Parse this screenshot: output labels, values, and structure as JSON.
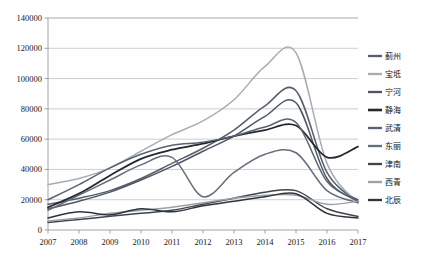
{
  "chart_data": {
    "type": "line",
    "title": "",
    "subtitle": "",
    "xlabel": "",
    "ylabel": "",
    "grid": true,
    "legend_position": "right",
    "x": [
      2007,
      2008,
      2009,
      2010,
      2011,
      2012,
      2013,
      2014,
      2015,
      2016,
      2017
    ],
    "xtick_labels": [
      "2007",
      "2008",
      "2009",
      "2010",
      "2011",
      "2012",
      "2013",
      "2014",
      "2015",
      "2016",
      "2017"
    ],
    "ylim": [
      0,
      140000
    ],
    "ytick_values": [
      0,
      20000,
      40000,
      60000,
      80000,
      100000,
      120000,
      140000
    ],
    "ytick_labels": [
      "0",
      "20000",
      "40000",
      "60000",
      "80000",
      "100000",
      "120000",
      "140000"
    ],
    "series": [
      {
        "name": "蓟州",
        "color": "#555f6b",
        "width": 1.5,
        "values": [
          17000,
          21000,
          26000,
          34000,
          44000,
          54000,
          66000,
          82000,
          92000,
          38000,
          19000
        ]
      },
      {
        "name": "宝坻",
        "color": "#a8adb3",
        "width": 1.5,
        "values": [
          30000,
          34000,
          41000,
          52000,
          63000,
          72000,
          86000,
          108000,
          117000,
          44000,
          18000
        ]
      },
      {
        "name": "宁河",
        "color": "#4d5662",
        "width": 1.5,
        "values": [
          14000,
          19000,
          25000,
          33000,
          42000,
          52000,
          62000,
          75000,
          84000,
          34000,
          19000
        ]
      },
      {
        "name": "静海",
        "color": "#24282d",
        "width": 1.8,
        "values": [
          15000,
          24000,
          36000,
          47000,
          53000,
          57000,
          62000,
          66000,
          69000,
          48000,
          55000
        ]
      },
      {
        "name": "武清",
        "color": "#596370",
        "width": 1.5,
        "values": [
          20000,
          30000,
          41000,
          50000,
          56000,
          58000,
          62000,
          68000,
          71000,
          32000,
          20000
        ]
      },
      {
        "name": "东丽",
        "color": "#646e7a",
        "width": 1.5,
        "values": [
          13000,
          23000,
          33000,
          43000,
          48000,
          22000,
          38000,
          50000,
          51000,
          26000,
          18000
        ]
      },
      {
        "name": "津南",
        "color": "#3f454d",
        "width": 1.5,
        "values": [
          5000,
          7000,
          9000,
          11000,
          13000,
          17000,
          21000,
          25000,
          26000,
          14000,
          9000
        ]
      },
      {
        "name": "西青",
        "color": "#9aa0a7",
        "width": 1.5,
        "values": [
          6000,
          8000,
          11000,
          13000,
          15000,
          18000,
          21000,
          23000,
          23000,
          17000,
          19000
        ]
      },
      {
        "name": "北辰",
        "color": "#2f343a",
        "width": 1.5,
        "values": [
          8000,
          12000,
          10000,
          14000,
          12000,
          16000,
          19000,
          22000,
          24000,
          11000,
          8000
        ]
      }
    ]
  },
  "plot": {
    "left": 48,
    "top": 18,
    "right": 358,
    "bottom": 230
  },
  "legend": {
    "x": 368,
    "y_start": 56,
    "row_height": 18,
    "swatch_length": 14
  }
}
